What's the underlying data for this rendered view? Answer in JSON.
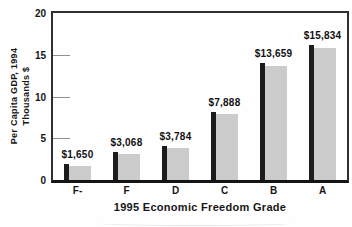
{
  "chart_data": {
    "type": "bar",
    "title": "",
    "xlabel": "1995 Economic Freedom Grade",
    "ylabel_line1": "Per Capita GDP, 1994",
    "ylabel_line2": "Thousands $",
    "categories": [
      "F-",
      "F",
      "D",
      "C",
      "B",
      "A"
    ],
    "values": [
      1650,
      3068,
      3784,
      7888,
      13659,
      15834
    ],
    "value_labels": [
      "$1,650",
      "$3,068",
      "$3,784",
      "$7,888",
      "$13,659",
      "$15,834"
    ],
    "value_unit": "dollars per capita",
    "y_axis_unit": "thousands of dollars",
    "ylim": [
      0,
      20
    ],
    "yticks": [
      0,
      5,
      10,
      15,
      20
    ],
    "grid": "none",
    "legend": "none",
    "bar_style": "light gray bar with darker black accent strip on left edge",
    "colors": {
      "bar_fill": "#cbcbcb",
      "bar_accent": "#1c1c1c",
      "axis": "#2f2f2f",
      "axis_bottom": "#141414",
      "tick_line": "#8f8f8f",
      "text": "#161616",
      "background": "#fefefe"
    }
  }
}
